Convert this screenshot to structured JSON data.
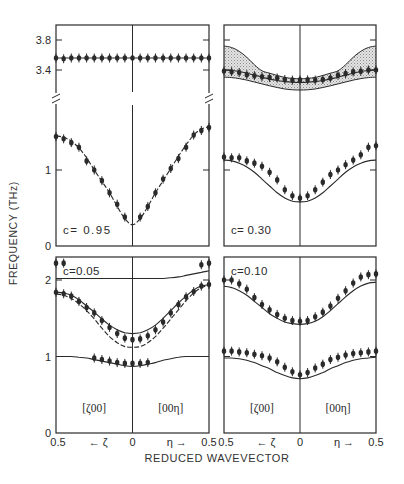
{
  "chart_data": {
    "type": "line",
    "ylabel": "FREQUENCY (THz)",
    "xlabel": "REDUCED WAVEVECTOR",
    "x_axis_ticks": [
      "0.5",
      "← ζ",
      "0",
      "η →",
      "0.5"
    ],
    "direction_labels": [
      "[ζ00]",
      "[00η]"
    ],
    "x": [
      -0.5,
      -0.45,
      -0.4,
      -0.35,
      -0.3,
      -0.25,
      -0.2,
      -0.15,
      -0.1,
      -0.05,
      0,
      0.05,
      0.1,
      0.15,
      0.2,
      0.25,
      0.3,
      0.35,
      0.4,
      0.45,
      0.5
    ],
    "panels": [
      {
        "id": "c095",
        "label": "c= 0.95",
        "position": "top-left",
        "yticks": [
          "0",
          "1",
          "3.4",
          "3.8"
        ],
        "axis_break": true,
        "series": [
          {
            "name": "upper branch (calc)",
            "style": "solid",
            "values": [
              3.56,
              3.56,
              3.56,
              3.56,
              3.56,
              3.56,
              3.56,
              3.56,
              3.56,
              3.56,
              3.56,
              3.56,
              3.56,
              3.56,
              3.56,
              3.56,
              3.56,
              3.56,
              3.56,
              3.56,
              3.56
            ]
          },
          {
            "name": "upper branch (meas)",
            "style": "points",
            "values": [
              3.56,
              3.55,
              3.56,
              3.56,
              3.56,
              3.56,
              3.56,
              3.56,
              3.56,
              3.56,
              3.56,
              3.56,
              3.56,
              3.56,
              3.56,
              3.56,
              3.56,
              3.56,
              3.56,
              3.56,
              3.56
            ]
          },
          {
            "name": "acoustic branch (calc)",
            "style": "dashed",
            "values": [
              1.45,
              1.43,
              1.38,
              1.29,
              1.16,
              1.0,
              0.85,
              0.7,
              0.52,
              0.36,
              0.28,
              0.36,
              0.52,
              0.7,
              0.86,
              1.02,
              1.18,
              1.33,
              1.46,
              1.54,
              1.57
            ]
          },
          {
            "name": "acoustic branch (meas)",
            "style": "points",
            "values": [
              1.44,
              1.41,
              1.36,
              1.3,
              1.12,
              1.0,
              0.86,
              0.7,
              0.55,
              0.38,
              null,
              0.38,
              0.52,
              0.7,
              0.88,
              1.02,
              1.15,
              1.3,
              1.46,
              1.52,
              1.56
            ]
          }
        ]
      },
      {
        "id": "c030",
        "label": "c= 0.30",
        "position": "top-right",
        "yticks": [
          "0",
          "1",
          "3.4",
          "3.8"
        ],
        "axis_break": false,
        "series": [
          {
            "name": "band upper edge",
            "style": "solid",
            "values": [
              3.72,
              3.7,
              3.65,
              3.57,
              3.47,
              3.36,
              3.25,
              3.14,
              3.05,
              3.0,
              2.98,
              3.0,
              3.05,
              3.14,
              3.25,
              3.36,
              3.47,
              3.57,
              3.65,
              3.7,
              3.72
            ]
          },
          {
            "name": "band middle (calc)",
            "style": "solid",
            "values": [
              3.4,
              3.38,
              3.33,
              3.25,
              3.16,
              3.06,
              2.97,
              2.9,
              2.85,
              2.82,
              2.81,
              2.82,
              2.85,
              2.9,
              2.97,
              3.06,
              3.16,
              3.25,
              3.33,
              3.38,
              3.4
            ]
          },
          {
            "name": "band lower edge",
            "style": "solid",
            "values": [
              3.06,
              3.04,
              2.99,
              2.92,
              2.83,
              2.74,
              2.65,
              2.57,
              2.5,
              2.46,
              2.45,
              2.46,
              2.5,
              2.57,
              2.65,
              2.74,
              2.83,
              2.92,
              2.99,
              3.04,
              3.06
            ]
          },
          {
            "name": "optic branch (meas)",
            "style": "points",
            "values": [
              3.35,
              3.32,
              3.28,
              3.18,
              3.13,
              3.08,
              3.04,
              3.02,
              2.95,
              2.92,
              2.93,
              2.93,
              2.92,
              2.95,
              3.02,
              3.15,
              3.23,
              3.31,
              3.34,
              3.4,
              3.4
            ]
          },
          {
            "name": "acoustic branch (calc)",
            "style": "solid",
            "values": [
              1.13,
              1.12,
              1.09,
              1.04,
              0.97,
              0.88,
              0.79,
              0.7,
              0.63,
              0.59,
              0.58,
              0.59,
              0.63,
              0.7,
              0.79,
              0.88,
              0.97,
              1.04,
              1.09,
              1.12,
              1.13
            ]
          },
          {
            "name": "acoustic branch (meas)",
            "style": "points",
            "values": [
              1.17,
              1.16,
              1.16,
              1.12,
              1.09,
              1.05,
              0.97,
              0.87,
              0.74,
              0.66,
              0.63,
              0.66,
              0.74,
              0.84,
              0.94,
              1.0,
              1.07,
              1.13,
              1.2,
              1.3,
              1.32
            ]
          }
        ]
      },
      {
        "id": "c005",
        "label": "c=0.05",
        "position": "bottom-left",
        "yticks": [
          "0",
          "1",
          "2"
        ],
        "axis_break": false,
        "series": [
          {
            "name": "top branch (calc)",
            "style": "solid",
            "values": [
              2.02,
              2.02,
              2.02,
              2.02,
              2.02,
              2.02,
              2.02,
              2.02,
              2.02,
              2.02,
              2.02,
              2.02,
              2.02,
              2.02,
              2.02,
              2.03,
              2.04,
              2.06,
              2.08,
              2.1,
              2.12
            ]
          },
          {
            "name": "top branch (meas)",
            "style": "points",
            "values": [
              2.22,
              2.22,
              null,
              null,
              null,
              null,
              null,
              null,
              null,
              null,
              null,
              null,
              null,
              null,
              null,
              null,
              null,
              null,
              null,
              2.2,
              2.22
            ]
          },
          {
            "name": "middle branch upper (calc)",
            "style": "solid",
            "values": [
              1.84,
              1.83,
              1.8,
              1.74,
              1.66,
              1.58,
              1.49,
              1.41,
              1.35,
              1.31,
              1.3,
              1.31,
              1.35,
              1.41,
              1.5,
              1.6,
              1.7,
              1.79,
              1.87,
              1.92,
              1.94
            ]
          },
          {
            "name": "middle branch lower (calc)",
            "style": "dashed",
            "values": [
              1.82,
              1.8,
              1.76,
              1.69,
              1.6,
              1.49,
              1.37,
              1.26,
              1.18,
              1.13,
              1.12,
              1.13,
              1.18,
              1.26,
              1.37,
              1.49,
              1.61,
              1.73,
              1.83,
              1.9,
              1.93
            ]
          },
          {
            "name": "middle branch (meas)",
            "style": "points",
            "values": [
              1.84,
              1.82,
              1.79,
              1.72,
              1.64,
              1.57,
              1.47,
              1.38,
              1.3,
              1.24,
              1.22,
              1.23,
              1.27,
              1.35,
              1.45,
              1.57,
              1.68,
              1.78,
              1.85,
              1.92,
              1.94
            ]
          },
          {
            "name": "low branch (calc)",
            "style": "solid",
            "values": [
              1.0,
              1.0,
              1.0,
              0.99,
              0.98,
              0.96,
              0.94,
              0.92,
              0.9,
              0.88,
              0.87,
              0.88,
              0.9,
              0.92,
              0.95,
              0.97,
              0.99,
              1.0,
              1.0,
              1.0,
              1.0
            ]
          },
          {
            "name": "low branch (meas)",
            "style": "points",
            "values": [
              null,
              null,
              null,
              null,
              null,
              0.98,
              0.96,
              0.94,
              0.92,
              0.91,
              0.91,
              0.91,
              0.92,
              null,
              null,
              null,
              null,
              null,
              null,
              null,
              null
            ]
          }
        ]
      },
      {
        "id": "c010",
        "label": "c=0.10",
        "position": "bottom-right",
        "yticks": [
          "0",
          "1",
          "2"
        ],
        "axis_break": false,
        "series": [
          {
            "name": "upper branch (calc)",
            "style": "solid",
            "values": [
              1.92,
              1.9,
              1.86,
              1.8,
              1.72,
              1.64,
              1.56,
              1.5,
              1.45,
              1.43,
              1.42,
              1.43,
              1.46,
              1.52,
              1.6,
              1.69,
              1.78,
              1.86,
              1.92,
              1.96,
              1.97
            ]
          },
          {
            "name": "upper branch (meas)",
            "style": "points",
            "values": [
              2.0,
              2.0,
              1.95,
              1.88,
              1.77,
              1.68,
              1.61,
              1.55,
              1.5,
              1.47,
              1.46,
              1.47,
              1.52,
              1.58,
              1.66,
              1.76,
              1.86,
              1.96,
              2.04,
              2.07,
              2.08
            ]
          },
          {
            "name": "lower branch (calc)",
            "style": "solid",
            "values": [
              0.98,
              0.98,
              0.97,
              0.95,
              0.92,
              0.88,
              0.84,
              0.79,
              0.75,
              0.72,
              0.71,
              0.72,
              0.75,
              0.79,
              0.84,
              0.88,
              0.92,
              0.95,
              0.97,
              0.98,
              0.99
            ]
          },
          {
            "name": "lower branch (meas)",
            "style": "points",
            "values": [
              1.07,
              1.07,
              1.06,
              1.05,
              1.03,
              1.01,
              0.98,
              0.93,
              0.86,
              0.8,
              0.76,
              0.79,
              0.85,
              0.9,
              0.96,
              0.99,
              1.02,
              1.04,
              1.05,
              1.06,
              1.07
            ]
          }
        ]
      }
    ]
  },
  "colors": {
    "ink": "#2a2a2a",
    "band_fill": "#cfcfcf",
    "background": "#ffffff"
  }
}
